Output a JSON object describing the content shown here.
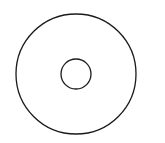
{
  "diagram": {
    "type": "concentric-circles",
    "width": 165,
    "height": 143,
    "background": "#ffffff",
    "stroke_color": "#1a1a1a",
    "outer_circle": {
      "cx": 76,
      "cy": 74,
      "r": 60,
      "stroke_width": 1.3
    },
    "inner_circle": {
      "cx": 76,
      "cy": 74,
      "r": 15,
      "stroke_width": 1.3
    }
  }
}
